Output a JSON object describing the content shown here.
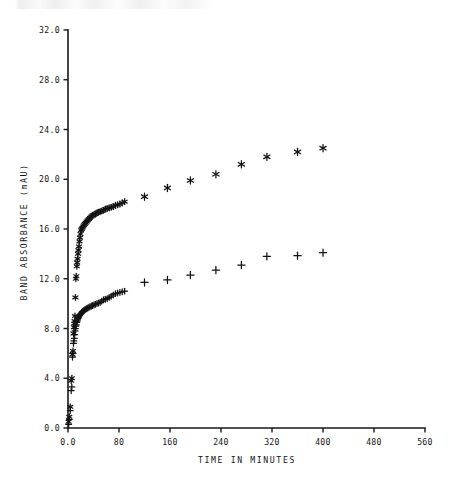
{
  "figure": {
    "background_color": "#ffffff",
    "ink_color": "#121212",
    "top_edge_artifact": "partial-cropped-text-row"
  },
  "chart_data": {
    "type": "scatter",
    "title": "",
    "xlabel": "TIME IN MINUTES",
    "ylabel": "BAND ABSORBANCE (mAU)",
    "xlim": [
      0,
      560
    ],
    "ylim": [
      0,
      32
    ],
    "grid": false,
    "legend_position": "none",
    "xticks": [
      0,
      80,
      160,
      240,
      320,
      400,
      480,
      560
    ],
    "xticklabels": [
      "0.0",
      "80",
      "160",
      "240",
      "320",
      "400",
      "480",
      "560"
    ],
    "yticks": [
      0,
      4,
      8,
      12,
      16,
      20,
      24,
      28,
      32
    ],
    "yticklabels": [
      "0.0",
      "4.0",
      "8.0",
      "12.0",
      "16.0",
      "20.0",
      "24.0",
      "28.0",
      "32.0"
    ],
    "series": [
      {
        "name": "upper-curve",
        "marker": "asterisk",
        "color": "#121212",
        "points": [
          [
            1.0,
            0.5
          ],
          [
            2.0,
            0.9
          ],
          [
            3.5,
            1.7
          ],
          [
            5.0,
            3.8
          ],
          [
            6.0,
            4.0
          ],
          [
            7.0,
            5.9
          ],
          [
            7.8,
            6.2
          ],
          [
            8.6,
            7.6
          ],
          [
            9.2,
            8.1
          ],
          [
            9.8,
            8.4
          ],
          [
            10.4,
            8.6
          ],
          [
            11.0,
            9.0
          ],
          [
            11.6,
            10.5
          ],
          [
            12.4,
            12.0
          ],
          [
            13.0,
            12.2
          ],
          [
            13.8,
            13.0
          ],
          [
            14.4,
            13.3
          ],
          [
            15.0,
            13.6
          ],
          [
            15.8,
            14.0
          ],
          [
            16.4,
            14.3
          ],
          [
            17.2,
            14.6
          ],
          [
            18.0,
            15.0
          ],
          [
            18.8,
            15.3
          ],
          [
            19.6,
            15.6
          ],
          [
            20.6,
            15.9
          ],
          [
            21.6,
            16.0
          ],
          [
            22.6,
            16.1
          ],
          [
            23.8,
            16.2
          ],
          [
            25.0,
            16.3
          ],
          [
            26.4,
            16.4
          ],
          [
            27.8,
            16.5
          ],
          [
            29.4,
            16.6
          ],
          [
            31.0,
            16.7
          ],
          [
            32.8,
            16.8
          ],
          [
            34.6,
            16.9
          ],
          [
            36.6,
            17.0
          ],
          [
            38.6,
            17.1
          ],
          [
            40.8,
            17.15
          ],
          [
            43.0,
            17.2
          ],
          [
            45.4,
            17.3
          ],
          [
            47.8,
            17.35
          ],
          [
            50.4,
            17.4
          ],
          [
            53.0,
            17.45
          ],
          [
            55.8,
            17.5
          ],
          [
            58.6,
            17.6
          ],
          [
            61.6,
            17.65
          ],
          [
            64.6,
            17.7
          ],
          [
            67.8,
            17.75
          ],
          [
            71.0,
            17.8
          ],
          [
            74.4,
            17.9
          ],
          [
            77.8,
            17.95
          ],
          [
            81.4,
            18.0
          ],
          [
            85.0,
            18.1
          ],
          [
            88.8,
            18.2
          ],
          [
            120.0,
            18.6
          ],
          [
            156.0,
            19.3
          ],
          [
            192.0,
            19.9
          ],
          [
            232.0,
            20.4
          ],
          [
            272.0,
            21.2
          ],
          [
            312.0,
            21.8
          ],
          [
            360.0,
            22.2
          ],
          [
            400.0,
            22.5
          ]
        ]
      },
      {
        "name": "lower-curve",
        "marker": "plus",
        "color": "#121212",
        "points": [
          [
            1.0,
            0.3
          ],
          [
            2.0,
            0.7
          ],
          [
            3.5,
            1.4
          ],
          [
            5.0,
            3.0
          ],
          [
            6.0,
            3.3
          ],
          [
            7.0,
            5.7
          ],
          [
            7.8,
            6.0
          ],
          [
            8.6,
            6.8
          ],
          [
            9.2,
            7.0
          ],
          [
            9.8,
            7.2
          ],
          [
            10.4,
            7.5
          ],
          [
            11.0,
            7.8
          ],
          [
            11.6,
            8.0
          ],
          [
            12.4,
            8.2
          ],
          [
            13.0,
            8.3
          ],
          [
            13.8,
            8.5
          ],
          [
            14.4,
            8.6
          ],
          [
            15.0,
            8.7
          ],
          [
            15.8,
            8.8
          ],
          [
            16.4,
            8.9
          ],
          [
            17.2,
            9.0
          ],
          [
            18.0,
            9.05
          ],
          [
            18.8,
            9.1
          ],
          [
            19.6,
            9.15
          ],
          [
            20.6,
            9.2
          ],
          [
            21.6,
            9.3
          ],
          [
            22.6,
            9.35
          ],
          [
            23.8,
            9.4
          ],
          [
            25.0,
            9.45
          ],
          [
            26.4,
            9.5
          ],
          [
            27.8,
            9.55
          ],
          [
            29.4,
            9.6
          ],
          [
            31.0,
            9.65
          ],
          [
            32.8,
            9.7
          ],
          [
            34.6,
            9.75
          ],
          [
            36.6,
            9.8
          ],
          [
            38.6,
            9.85
          ],
          [
            40.8,
            9.9
          ],
          [
            43.0,
            9.95
          ],
          [
            45.4,
            10.0
          ],
          [
            47.8,
            10.05
          ],
          [
            50.4,
            10.1
          ],
          [
            53.0,
            10.2
          ],
          [
            55.8,
            10.3
          ],
          [
            58.6,
            10.35
          ],
          [
            61.6,
            10.4
          ],
          [
            64.6,
            10.5
          ],
          [
            67.8,
            10.6
          ],
          [
            71.0,
            10.7
          ],
          [
            74.4,
            10.8
          ],
          [
            77.8,
            10.85
          ],
          [
            81.4,
            10.9
          ],
          [
            85.0,
            10.95
          ],
          [
            88.8,
            11.0
          ],
          [
            120.0,
            11.7
          ],
          [
            156.0,
            11.9
          ],
          [
            192.0,
            12.3
          ],
          [
            232.0,
            12.7
          ],
          [
            272.0,
            13.1
          ],
          [
            312.0,
            13.8
          ],
          [
            360.0,
            13.85
          ],
          [
            400.0,
            14.1
          ]
        ]
      }
    ]
  }
}
